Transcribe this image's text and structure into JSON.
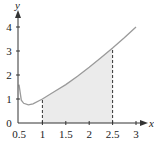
{
  "chart_data": {
    "type": "area",
    "title": "",
    "xlabel": "x",
    "ylabel": "y",
    "xlim": [
      0.5,
      3.1
    ],
    "ylim": [
      0,
      4.4
    ],
    "x_ticks": [
      "0.5",
      "1",
      "1.5",
      "2",
      "2.5",
      "3"
    ],
    "y_ticks": [
      "0",
      "1",
      "2",
      "3",
      "4"
    ],
    "grid": false,
    "series": [
      {
        "name": "curve",
        "x": [
          0.5,
          0.55,
          0.6,
          0.7,
          0.8,
          1.0,
          1.25,
          1.5,
          1.75,
          2.0,
          2.25,
          2.5,
          2.75,
          3.0
        ],
        "values": [
          1.6,
          0.95,
          0.82,
          0.76,
          0.8,
          1.0,
          1.3,
          1.6,
          1.95,
          2.32,
          2.72,
          3.12,
          3.55,
          4.0
        ]
      }
    ],
    "shaded_region": {
      "x_from": 1,
      "x_to": 2.5,
      "color": "#ebebeb"
    },
    "annotations": [
      {
        "type": "dashed-vertical",
        "x": 1
      },
      {
        "type": "dashed-vertical",
        "x": 2.5
      }
    ]
  }
}
